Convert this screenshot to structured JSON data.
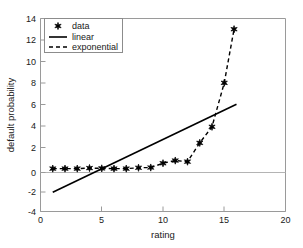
{
  "chart_data": {
    "type": "scatter",
    "title": "",
    "xlabel": "rating",
    "ylabel": "default probability",
    "xlim": [
      0,
      20
    ],
    "ylim": [
      -4,
      14
    ],
    "xticks": [
      0,
      5,
      10,
      15,
      20
    ],
    "yticks": [
      -4,
      -2,
      0,
      2,
      4,
      6,
      8,
      10,
      12,
      14
    ],
    "xtick_labels": [
      "0",
      "5",
      "10",
      "15",
      "20"
    ],
    "ytick_labels": [
      "-4",
      "-2",
      "0",
      "2",
      "4",
      "6",
      "8",
      "10",
      "12",
      "14"
    ],
    "grid": false,
    "legend_position": "upper left",
    "legend_entries": [
      "data",
      "linear",
      "exponential"
    ],
    "series": [
      {
        "name": "data",
        "type": "scatter",
        "marker": "hexagram",
        "color": "#000000",
        "x": [
          1,
          2,
          3,
          4,
          5,
          6,
          7,
          8,
          9,
          10,
          11,
          12,
          13,
          14,
          15,
          15.8
        ],
        "y": [
          0.0,
          0.0,
          0.0,
          0.05,
          0.02,
          0.0,
          0.0,
          0.08,
          0.1,
          0.5,
          0.75,
          0.65,
          2.4,
          3.9,
          8.0,
          13.0
        ]
      },
      {
        "name": "linear",
        "type": "line",
        "style": "solid",
        "color": "#000000",
        "x": [
          1,
          16
        ],
        "y": [
          -2.2,
          6.0
        ]
      },
      {
        "name": "exponential",
        "type": "line",
        "style": "dashed",
        "color": "#000000",
        "x": [
          1,
          2,
          3,
          4,
          5,
          6,
          7,
          8,
          9,
          10,
          11,
          12,
          13,
          14,
          15,
          15.8
        ],
        "y": [
          0.0,
          0.0,
          0.0,
          0.05,
          0.02,
          0.0,
          0.0,
          0.08,
          0.1,
          0.5,
          0.75,
          0.65,
          2.4,
          3.9,
          8.0,
          13.0
        ]
      }
    ]
  },
  "axes": {
    "xlabel": "rating",
    "ylabel": "default probability"
  },
  "legend": {
    "items": [
      {
        "label": "data",
        "glyph": "marker"
      },
      {
        "label": "linear",
        "glyph": "solid-line"
      },
      {
        "label": "exponential",
        "glyph": "dashed-line"
      }
    ]
  },
  "ticks": {
    "x": [
      "0",
      "5",
      "10",
      "15",
      "20"
    ],
    "y": [
      "14",
      "12",
      "10",
      "8",
      "6",
      "4",
      "2",
      "0",
      "-2",
      "-4"
    ]
  },
  "colors": {
    "axis": "#9a9a9a",
    "ink": "#000000",
    "background": "#ffffff",
    "zero_line": "#b4b4b4"
  }
}
